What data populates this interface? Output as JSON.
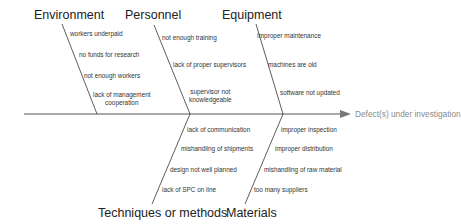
{
  "diagram": {
    "type": "fishbone",
    "effect": "Defect(s) under investigation",
    "categories": {
      "environment": {
        "label": "Environment",
        "causes": [
          "workers underpaid",
          "no funds for research",
          "not enough workers",
          "lack of management cooperation"
        ],
        "cause_lines": [
          "lack of management",
          "cooperation"
        ]
      },
      "personnel": {
        "label": "Personnel",
        "causes": [
          "not enough training",
          "lack of proper supervisors",
          "supervisor not knowledgeable"
        ],
        "cause_lines": [
          "supervisor not",
          "knowledgeable"
        ]
      },
      "equipment": {
        "label": "Equipment",
        "causes": [
          "Improper maintenance",
          "machines are old",
          "software not updated"
        ]
      },
      "techniques": {
        "label": "Techniques or methods",
        "causes": [
          "lack of communication",
          "mishandling of shipments",
          "design not well planned",
          "lack of SPC on line"
        ]
      },
      "materials": {
        "label": "Materials",
        "causes": [
          "improper inspection",
          "improper distribution",
          "mishandling of raw material",
          "too many suppliers"
        ]
      }
    },
    "colors": {
      "lines": "#333333",
      "arrow": "#777777",
      "effect_text": "#8a8a8a"
    }
  }
}
